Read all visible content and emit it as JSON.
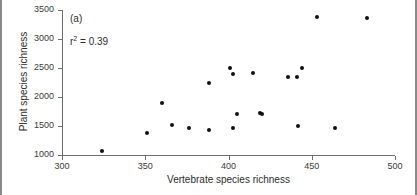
{
  "figure": {
    "panel_label": "(a)",
    "annotation_prefix": "r",
    "annotation_sup": "2",
    "annotation_suffix": " = 0.39",
    "point_color": "#111111",
    "axis_color": "#6e6e6e",
    "frame_color": "#8a8a8a"
  },
  "chart_data": {
    "type": "scatter",
    "title": "",
    "xlabel": "Vertebrate species richness",
    "ylabel": "Plant species richness",
    "xlim": [
      300,
      500
    ],
    "ylim": [
      1000,
      3500
    ],
    "xticks": [
      300,
      350,
      400,
      450,
      500
    ],
    "yticks": [
      1000,
      1500,
      2000,
      2500,
      3000,
      3500
    ],
    "xtick_labels": [
      "300",
      "350",
      "400",
      "450",
      "500"
    ],
    "ytick_labels": [
      "1000",
      "1500",
      "2000",
      "2500",
      "3000",
      "3500"
    ],
    "grid": false,
    "legend": false,
    "annotations": [
      {
        "text": "(a)",
        "x": 307,
        "y": 3400
      },
      {
        "text": "r2 = 0.39",
        "x": 307,
        "y": 3020
      }
    ],
    "series": [
      {
        "name": "sites",
        "marker": "filled-circle",
        "color": "#111111",
        "points": [
          {
            "x": 324,
            "y": 1065
          },
          {
            "x": 351,
            "y": 1380
          },
          {
            "x": 360,
            "y": 1890
          },
          {
            "x": 366,
            "y": 1510
          },
          {
            "x": 376,
            "y": 1460
          },
          {
            "x": 388,
            "y": 2250
          },
          {
            "x": 388,
            "y": 1425
          },
          {
            "x": 401,
            "y": 2500
          },
          {
            "x": 403,
            "y": 2400
          },
          {
            "x": 403,
            "y": 1460
          },
          {
            "x": 405,
            "y": 1700
          },
          {
            "x": 415,
            "y": 2410
          },
          {
            "x": 419,
            "y": 1725
          },
          {
            "x": 420,
            "y": 1700
          },
          {
            "x": 436,
            "y": 2340
          },
          {
            "x": 441,
            "y": 2340
          },
          {
            "x": 442,
            "y": 1500
          },
          {
            "x": 444,
            "y": 2500
          },
          {
            "x": 453,
            "y": 3380
          },
          {
            "x": 464,
            "y": 1470
          },
          {
            "x": 483,
            "y": 3370
          }
        ]
      }
    ]
  }
}
